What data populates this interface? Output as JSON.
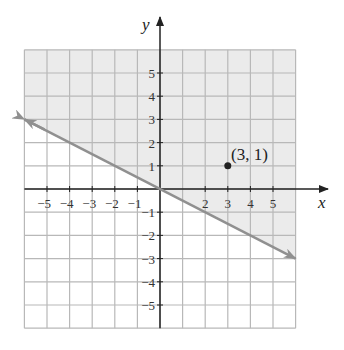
{
  "chart_data": {
    "type": "line",
    "title": "",
    "xlabel": "x",
    "ylabel": "y",
    "xlim": [
      -6,
      6
    ],
    "ylim": [
      -6,
      6
    ],
    "grid": true,
    "x_ticks": [
      -5,
      -4,
      -3,
      -2,
      -1,
      2,
      3,
      4,
      5
    ],
    "y_ticks": [
      5,
      4,
      3,
      2,
      1,
      -1,
      -2,
      -3,
      -4,
      -5
    ],
    "x_tick_labels": [
      "−5",
      "−4",
      "−3",
      "−2",
      "−1",
      "2",
      "3",
      "4",
      "5"
    ],
    "y_tick_labels": [
      "5",
      "4",
      "3",
      "2",
      "1",
      "−1",
      "−2",
      "−3",
      "−4",
      "−5"
    ],
    "series": [
      {
        "name": "boundary line y = -x/2",
        "x": [
          -6,
          6
        ],
        "y": [
          3,
          -3
        ],
        "style": "solid",
        "arrows": "both"
      }
    ],
    "shaded_region": "above line (y > -x/2)",
    "points": [
      {
        "x": 3,
        "y": 1,
        "label": "(3, 1)"
      }
    ],
    "colors": {
      "shade": "#ebebeb",
      "line": "#909090",
      "grid": "#b8b8b8",
      "axis": "#222222"
    }
  },
  "labels": {
    "x_axis": "x",
    "y_axis": "y",
    "point": "(3, 1)"
  }
}
